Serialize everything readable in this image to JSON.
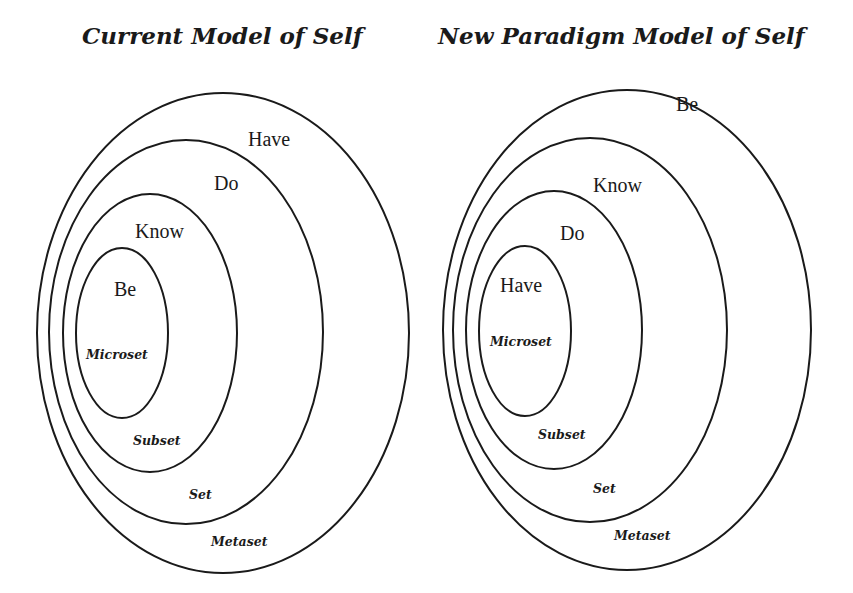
{
  "diagrams": [
    {
      "title": "Current Model of Self",
      "levels": [
        {
          "name": "Have",
          "set": "Metaset"
        },
        {
          "name": "Do",
          "set": "Set"
        },
        {
          "name": "Know",
          "set": "Subset"
        },
        {
          "name": "Be",
          "set": "Microset"
        }
      ]
    },
    {
      "title": "New Paradigm Model of Self",
      "levels": [
        {
          "name": "Be",
          "set": "Metaset"
        },
        {
          "name": "Know",
          "set": "Set"
        },
        {
          "name": "Do",
          "set": "Subset"
        },
        {
          "name": "Have",
          "set": "Microset"
        }
      ]
    }
  ],
  "colors": {
    "stroke": "#1a1a1a",
    "background": "#ffffff"
  }
}
